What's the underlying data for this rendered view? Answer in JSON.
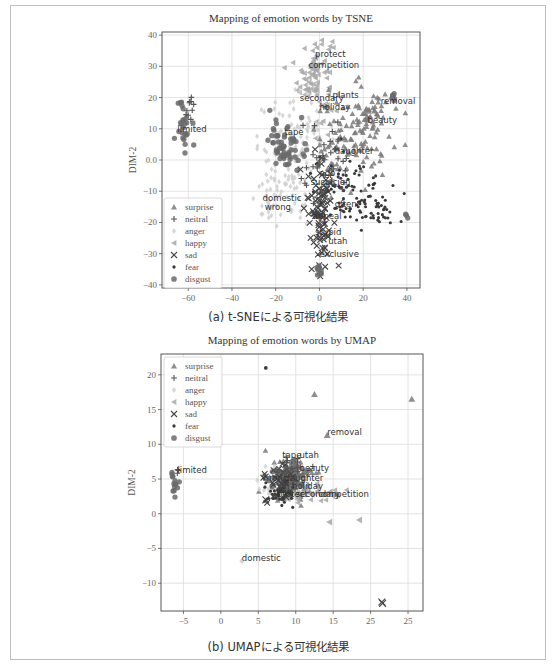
{
  "figure": {
    "captions": [
      "(a) t-SNEによる可視化結果",
      "(b) UMAPによる可視化結果"
    ]
  },
  "legend": {
    "entries": [
      {
        "label": "surprise",
        "marker": "triangle-up",
        "color": "#7a7a7a"
      },
      {
        "label": "neitral",
        "marker": "plus",
        "color": "#555555"
      },
      {
        "label": "anger",
        "marker": "diamond",
        "color": "#d0d0d0"
      },
      {
        "label": "happy",
        "marker": "triangle-left",
        "color": "#a8a8a8"
      },
      {
        "label": "sad",
        "marker": "x",
        "color": "#444444"
      },
      {
        "label": "fear",
        "marker": "dot",
        "color": "#3a3a3a"
      },
      {
        "label": "disgust",
        "marker": "circle",
        "color": "#6a6a6a"
      }
    ]
  },
  "chart_data": [
    {
      "type": "scatter",
      "title": "Mapping of emotion words by TSNE",
      "xlabel": "DIM-1",
      "ylabel": "DIM-2",
      "xlim": [
        -72,
        46
      ],
      "ylim": [
        -41,
        41
      ],
      "xticks": [
        -60,
        -40,
        -20,
        0,
        20,
        40
      ],
      "xtick_labels": [
        "−60",
        "−40",
        "−20",
        "0",
        "20",
        "40"
      ],
      "yticks": [
        -40,
        -30,
        -20,
        -10,
        0,
        10,
        20,
        30,
        40
      ],
      "ytick_labels": [
        "−40",
        "−30",
        "−20",
        "−10",
        "0.0",
        "10",
        "20",
        "30",
        "40"
      ],
      "grid": true,
      "legend_position": "lower left",
      "annotations": [
        {
          "text": "protect",
          "x": -2,
          "y": 33
        },
        {
          "text": "competition",
          "x": -5,
          "y": 29.5
        },
        {
          "text": "secondary",
          "x": -9,
          "y": 19
        },
        {
          "text": "plants",
          "x": 6,
          "y": 20
        },
        {
          "text": "holiday",
          "x": 0,
          "y": 16
        },
        {
          "text": "removal",
          "x": 28,
          "y": 18
        },
        {
          "text": "beauty",
          "x": 22,
          "y": 12
        },
        {
          "text": "limited",
          "x": -65,
          "y": 9
        },
        {
          "text": "tape",
          "x": -16,
          "y": 8
        },
        {
          "text": "daughter",
          "x": 7,
          "y": 2
        },
        {
          "text": "ago",
          "x": 0,
          "y": -5
        },
        {
          "text": "suspicion",
          "x": -4,
          "y": -8
        },
        {
          "text": "domestic",
          "x": -26,
          "y": -13
        },
        {
          "text": "wrong",
          "x": -25,
          "y": -16
        },
        {
          "text": "often",
          "x": 7,
          "y": -15
        },
        {
          "text": "appeal",
          "x": -3,
          "y": -19
        },
        {
          "text": "stupid",
          "x": -2,
          "y": -24
        },
        {
          "text": "utah",
          "x": 4,
          "y": -27
        },
        {
          "text": "exclusive",
          "x": 0,
          "y": -31
        }
      ],
      "clusters": [
        {
          "class": "happy",
          "cx": -2,
          "cy": 27,
          "sx": 4,
          "sy": 7,
          "n": 90
        },
        {
          "class": "anger",
          "cx": -10,
          "cy": 4,
          "sx": 9,
          "sy": 8,
          "n": 120
        },
        {
          "class": "anger",
          "cx": -20,
          "cy": -12,
          "sx": 6,
          "sy": 4,
          "n": 50
        },
        {
          "class": "disgust",
          "cx": -15,
          "cy": 5,
          "sx": 4,
          "sy": 4,
          "n": 60
        },
        {
          "class": "disgust",
          "cx": -62,
          "cy": 12,
          "sx": 1.5,
          "sy": 4,
          "n": 25
        },
        {
          "class": "neitral",
          "cx": -59,
          "cy": 16,
          "sx": 1,
          "sy": 2,
          "n": 10
        },
        {
          "class": "surprise",
          "cx": 15,
          "cy": 6,
          "sx": 9,
          "sy": 8,
          "n": 110
        },
        {
          "class": "surprise",
          "cx": 25,
          "cy": 16,
          "sx": 4,
          "sy": 3,
          "n": 30
        },
        {
          "class": "sad",
          "cx": 0,
          "cy": -15,
          "sx": 3,
          "sy": 9,
          "n": 90
        },
        {
          "class": "fear",
          "cx": 15,
          "cy": -10,
          "sx": 9,
          "sy": 6,
          "n": 90
        },
        {
          "class": "fear",
          "cx": 28,
          "cy": -17,
          "sx": 5,
          "sy": 2,
          "n": 25
        },
        {
          "class": "disgust",
          "cx": 0,
          "cy": -36,
          "sx": 0.5,
          "sy": 2,
          "n": 10
        },
        {
          "class": "disgust",
          "cx": 34,
          "cy": 20,
          "sx": 0.5,
          "sy": 1,
          "n": 6
        },
        {
          "class": "disgust",
          "cx": 40,
          "cy": -18,
          "sx": 0.5,
          "sy": 0.5,
          "n": 3
        },
        {
          "class": "neitral",
          "cx": 3,
          "cy": -2,
          "sx": 6,
          "sy": 6,
          "n": 40
        }
      ]
    },
    {
      "type": "scatter",
      "title": "Mapping of emotion words by UMAP",
      "xlabel": "DIM-1",
      "ylabel": "DIM-2",
      "xlim": [
        -8,
        27
      ],
      "ylim": [
        -14,
        23
      ],
      "xticks": [
        -5,
        0,
        5,
        10,
        15,
        20,
        25
      ],
      "xtick_labels": [
        "−5",
        "0",
        "5",
        "10",
        "15",
        "25",
        "25"
      ],
      "yticks": [
        -10,
        -5,
        0,
        5,
        10,
        15,
        20
      ],
      "ytick_labels": [
        "−10",
        "−5",
        "0",
        "5",
        "10",
        "15",
        "20"
      ],
      "grid": true,
      "legend_position": "upper left",
      "annotations": [
        {
          "text": "removal",
          "x": 14.2,
          "y": 11.3
        },
        {
          "text": "tape",
          "x": 8.2,
          "y": 8
        },
        {
          "text": "utah",
          "x": 10.5,
          "y": 8
        },
        {
          "text": "beauty",
          "x": 10.5,
          "y": 6.2
        },
        {
          "text": "wrong",
          "x": 5.5,
          "y": 4.7
        },
        {
          "text": "daughter",
          "x": 8.5,
          "y": 4.7
        },
        {
          "text": "holiday",
          "x": 9.5,
          "y": 3.6
        },
        {
          "text": "protect",
          "x": 7.5,
          "y": 2.4
        },
        {
          "text": "secondary",
          "x": 10,
          "y": 2.4
        },
        {
          "text": "competition",
          "x": 13,
          "y": 2.4
        },
        {
          "text": "limited",
          "x": -5.8,
          "y": 5.8
        },
        {
          "text": "domestic",
          "x": 2.8,
          "y": -6.8
        }
      ],
      "clusters": [
        {
          "class": "surprise",
          "cx": 9.5,
          "cy": 4.5,
          "sx": 1.6,
          "sy": 1.6,
          "n": 80
        },
        {
          "class": "anger",
          "cx": 8,
          "cy": 4.5,
          "sx": 1.5,
          "sy": 1.0,
          "n": 40
        },
        {
          "class": "happy",
          "cx": 12,
          "cy": 3,
          "sx": 2,
          "sy": 0.6,
          "n": 40
        },
        {
          "class": "disgust",
          "cx": 9,
          "cy": 5,
          "sx": 1.2,
          "sy": 1.4,
          "n": 50
        },
        {
          "class": "fear",
          "cx": 8,
          "cy": 3,
          "sx": 1,
          "sy": 0.8,
          "n": 50
        },
        {
          "class": "sad",
          "cx": 8,
          "cy": 5,
          "sx": 1,
          "sy": 1.2,
          "n": 30
        },
        {
          "class": "neitral",
          "cx": 9,
          "cy": 6,
          "sx": 1,
          "sy": 1,
          "n": 25
        },
        {
          "class": "disgust",
          "cx": -6.3,
          "cy": 4.5,
          "sx": 0.3,
          "sy": 0.8,
          "n": 14
        },
        {
          "class": "neitral",
          "cx": -5.8,
          "cy": 6,
          "sx": 0.1,
          "sy": 0.2,
          "n": 3
        }
      ],
      "points": [
        {
          "class": "surprise",
          "x": 12.5,
          "y": 17.2
        },
        {
          "class": "surprise",
          "x": 25.5,
          "y": 16.5
        },
        {
          "class": "surprise",
          "x": 14.2,
          "y": 11.3
        },
        {
          "class": "fear",
          "x": 6,
          "y": 21
        },
        {
          "class": "happy",
          "x": 14.5,
          "y": -1.2
        },
        {
          "class": "happy",
          "x": 18.5,
          "y": -0.9
        },
        {
          "class": "anger",
          "x": 2.8,
          "y": -6.8
        },
        {
          "class": "sad",
          "x": 6,
          "y": 2
        },
        {
          "class": "sad",
          "x": 21.5,
          "y": -12.7
        },
        {
          "class": "sad",
          "x": 21.6,
          "y": -12.9
        }
      ]
    }
  ]
}
